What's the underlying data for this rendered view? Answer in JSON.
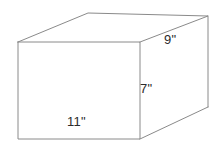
{
  "figure": {
    "shape": "rectangular-prism",
    "background_color": "#ffffff",
    "line_color": "#8a8a8a",
    "label_color": "#2b2b2b",
    "face_fill": "#ffffff"
  },
  "labels": {
    "depth": "9\"",
    "height": "7\"",
    "width": "11\""
  },
  "dimensions": {
    "width_value": 11,
    "height_value": 7,
    "depth_value": 9,
    "unit": "inches",
    "unit_symbol": "\""
  },
  "geometry": {
    "front_top_left": "18,42",
    "front_top_right": "140,42",
    "front_bottom_right": "140,139",
    "front_bottom_left": "18,139",
    "back_top_left": "88,13",
    "back_top_right": "208,16",
    "back_bottom_right": "208,107"
  }
}
